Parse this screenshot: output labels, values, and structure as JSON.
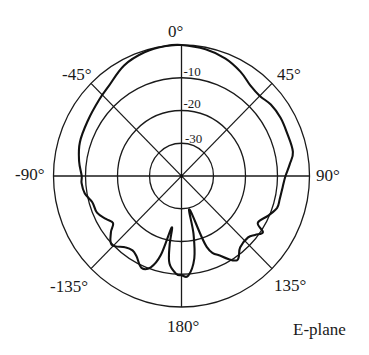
{
  "chart_data": {
    "type": "polar-line",
    "title": "",
    "annotation": "E-plane",
    "angle_unit": "degrees",
    "angle_direction": "clockwise from top (0° at top)",
    "angle_ticks": [
      {
        "angle": 0,
        "label": "0°"
      },
      {
        "angle": 45,
        "label": "45°"
      },
      {
        "angle": 90,
        "label": "90°"
      },
      {
        "angle": 135,
        "label": "135°"
      },
      {
        "angle": 180,
        "label": "180°"
      },
      {
        "angle": -135,
        "label": "-135°"
      },
      {
        "angle": -90,
        "label": "-90°"
      },
      {
        "angle": -45,
        "label": "-45°"
      }
    ],
    "radial_unit": "dB",
    "radial_range": [
      -40,
      0
    ],
    "radial_ticks": [
      {
        "value": -10,
        "label": "-10"
      },
      {
        "value": -20,
        "label": "-20"
      },
      {
        "value": -30,
        "label": "-30"
      }
    ],
    "grid": true,
    "series": [
      {
        "name": "E-plane pattern",
        "color": "#111111",
        "points": [
          {
            "angle": 0,
            "db": 0.0
          },
          {
            "angle": 11,
            "db": -0.6
          },
          {
            "angle": 21,
            "db": -1.6
          },
          {
            "angle": 30,
            "db": -3.2
          },
          {
            "angle": 38,
            "db": -5.0
          },
          {
            "angle": 45,
            "db": -5.4
          },
          {
            "angle": 52,
            "db": -4.6
          },
          {
            "angle": 60,
            "db": -4.3
          },
          {
            "angle": 68,
            "db": -4.5
          },
          {
            "angle": 78,
            "db": -4.4
          },
          {
            "angle": 84,
            "db": -6.0
          },
          {
            "angle": 90,
            "db": -7.5
          },
          {
            "angle": 96,
            "db": -8.2
          },
          {
            "angle": 103,
            "db": -8.5
          },
          {
            "angle": 108,
            "db": -8.6
          },
          {
            "angle": 114,
            "db": -10.3
          },
          {
            "angle": 121,
            "db": -12.2
          },
          {
            "angle": 124,
            "db": -9.3
          },
          {
            "angle": 128,
            "db": -10.8
          },
          {
            "angle": 132,
            "db": -12.0
          },
          {
            "angle": 140,
            "db": -11.5
          },
          {
            "angle": 146,
            "db": -9.0
          },
          {
            "angle": 153,
            "db": -12.5
          },
          {
            "angle": 160,
            "db": -17.0
          },
          {
            "angle": 166,
            "db": -29.5
          },
          {
            "angle": 168,
            "db": -22.0
          },
          {
            "angle": 171,
            "db": -14.5
          },
          {
            "angle": 176,
            "db": -9.5
          },
          {
            "angle": 180,
            "db": -9.7
          },
          {
            "angle": -177,
            "db": -10.0
          },
          {
            "angle": -172,
            "db": -13.0
          },
          {
            "angle": -170,
            "db": -18.5
          },
          {
            "angle": -169,
            "db": -24.0
          },
          {
            "angle": -165,
            "db": -15.0
          },
          {
            "angle": -161,
            "db": -10.5
          },
          {
            "angle": -156,
            "db": -9.3
          },
          {
            "angle": -150,
            "db": -11.8
          },
          {
            "angle": -146,
            "db": -12.6
          },
          {
            "angle": -141,
            "db": -12.0
          },
          {
            "angle": -134,
            "db": -9.7
          },
          {
            "angle": -128,
            "db": -12.0
          },
          {
            "angle": -124,
            "db": -14.2
          },
          {
            "angle": -119,
            "db": -13.0
          },
          {
            "angle": -113,
            "db": -11.3
          },
          {
            "angle": -106,
            "db": -11.0
          },
          {
            "angle": -100,
            "db": -9.3
          },
          {
            "angle": -94,
            "db": -8.7
          },
          {
            "angle": -90,
            "db": -8.8
          },
          {
            "angle": -82,
            "db": -7.7
          },
          {
            "angle": -72,
            "db": -6.6
          },
          {
            "angle": -60,
            "db": -6.2
          },
          {
            "angle": -48,
            "db": -5.3
          },
          {
            "angle": -40,
            "db": -4.4
          },
          {
            "angle": -28,
            "db": -1.8
          },
          {
            "angle": -17,
            "db": -0.5
          },
          {
            "angle": -7,
            "db": 0.0
          }
        ]
      }
    ]
  },
  "labels": {
    "angle_0": "0°",
    "angle_45": "45°",
    "angle_90": "90°",
    "angle_135": "135°",
    "angle_180": "180°",
    "angle_m135": "-135°",
    "angle_m90": "-90°",
    "angle_m45": "-45°",
    "ring_10": "-10",
    "ring_20": "-20",
    "ring_30": "-30",
    "annotation": "E-plane"
  }
}
